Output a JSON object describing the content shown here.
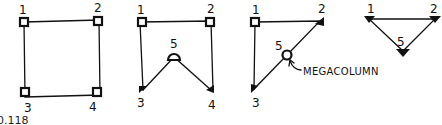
{
  "figure": {
    "caption": "0.118",
    "panels": [
      {
        "id": "panel-square",
        "shape": "square",
        "columns": [
          {
            "label": "1",
            "type": "square"
          },
          {
            "label": "2",
            "type": "square"
          },
          {
            "label": "3",
            "type": "square"
          },
          {
            "label": "4",
            "type": "square"
          }
        ]
      },
      {
        "id": "panel-v",
        "shape": "square-with-v-notch",
        "columns": [
          {
            "label": "1",
            "type": "square"
          },
          {
            "label": "2",
            "type": "square"
          },
          {
            "label": "5",
            "type": "round"
          },
          {
            "label": "3",
            "type": "triangle"
          },
          {
            "label": "4",
            "type": "triangle"
          }
        ]
      },
      {
        "id": "panel-right-triangle",
        "shape": "right-triangle",
        "columns": [
          {
            "label": "1",
            "type": "square"
          },
          {
            "label": "2",
            "type": "triangle"
          },
          {
            "label": "5",
            "type": "round"
          },
          {
            "label": "3",
            "type": "triangle"
          }
        ],
        "annotation": "MEGACOLUMN"
      },
      {
        "id": "panel-inverted-triangle",
        "shape": "inverted-triangle",
        "columns": [
          {
            "label": "1",
            "type": "triangle"
          },
          {
            "label": "2",
            "type": "triangle"
          },
          {
            "label": "5",
            "type": "triangle"
          }
        ]
      }
    ]
  }
}
